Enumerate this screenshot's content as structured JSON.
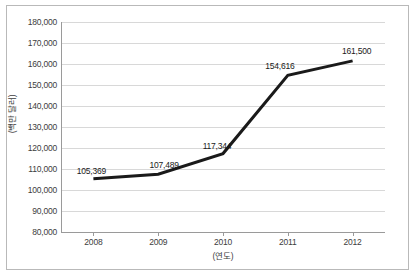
{
  "chart_data": {
    "type": "line",
    "title": "",
    "xlabel": "(연도)",
    "ylabel": "(백만 달러)",
    "categories": [
      "2008",
      "2009",
      "2010",
      "2011",
      "2012"
    ],
    "values": [
      105369,
      107489,
      117344,
      154616,
      161500
    ],
    "point_labels": [
      "105,369",
      "107,489",
      "117,344",
      "154,616",
      "161,500"
    ],
    "ylim": [
      80000,
      180000
    ],
    "ytick_step": 10000,
    "ytick_labels": [
      "180,000",
      "170,000",
      "160,000",
      "150,000",
      "140,000",
      "130,000",
      "120,000",
      "110,000",
      "100,000",
      "90,000",
      "80,000"
    ],
    "grid": true,
    "legend": "none",
    "series": [
      {
        "name": "",
        "color": "#1a1a1a",
        "line_width": 3,
        "values": [
          105369,
          107489,
          117344,
          154616,
          161500
        ]
      }
    ],
    "colors": {
      "line": "#1a1a1a",
      "grid": "#d8d8d8",
      "axis": "#9a9a9a",
      "frame": "#b9b9b9",
      "text": "#3d3d3d",
      "background": "#ffffff"
    }
  }
}
